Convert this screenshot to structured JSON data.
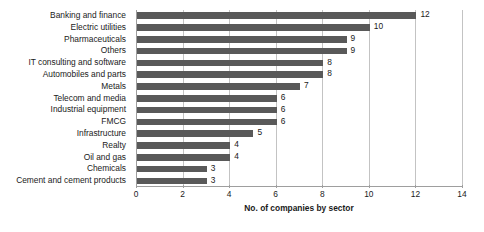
{
  "chart_data": {
    "type": "bar",
    "orientation": "horizontal",
    "title": "",
    "xlabel": "No. of companies by sector",
    "ylabel": "",
    "xlim": [
      0,
      14
    ],
    "xticks": [
      0,
      2,
      4,
      6,
      8,
      10,
      12,
      14
    ],
    "grid": true,
    "legend": null,
    "bar_color": "#595959",
    "gridline_color": "#c3c3c3",
    "axis_color": "#9e9e9e",
    "categories": [
      "Banking and finance",
      "Electric utilities",
      "Pharmaceuticals",
      "Others",
      "IT consulting and software",
      "Automobiles and parts",
      "Metals",
      "Telecom and media",
      "Industrial equipment",
      "FMCG",
      "Infrastructure",
      "Realty",
      "Oil and gas",
      "Chemicals",
      "Cement and cement products"
    ],
    "values": [
      12,
      10,
      9,
      9,
      8,
      8,
      7,
      6,
      6,
      6,
      5,
      4,
      4,
      3,
      3
    ],
    "data_labels": [
      "12",
      "10",
      "9",
      "9",
      "8",
      "8",
      "7",
      "6",
      "6",
      "6",
      "5",
      "4",
      "4",
      "3",
      "3"
    ]
  }
}
